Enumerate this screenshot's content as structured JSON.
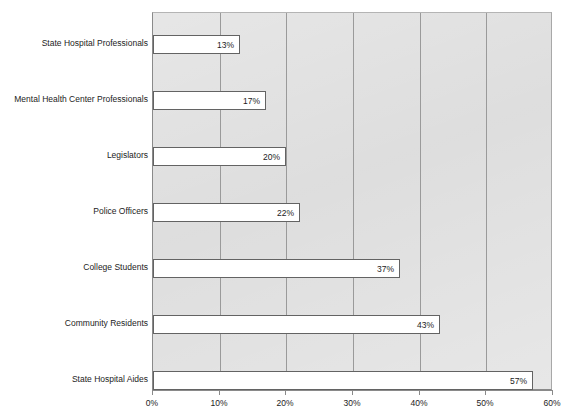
{
  "chart_data": {
    "type": "bar",
    "orientation": "horizontal",
    "title": "",
    "subtitle": "",
    "xlabel": "",
    "ylabel": "",
    "categories": [
      "State Hospital Professionals",
      "Mental Health Center Professionals",
      "Legislators",
      "Police Officers",
      "College Students",
      "Community Residents",
      "State Hospital Aides"
    ],
    "values": [
      13,
      17,
      20,
      22,
      37,
      43,
      57
    ],
    "value_labels": [
      "13%",
      "17%",
      "20%",
      "22%",
      "37%",
      "43%",
      "57%"
    ],
    "xlim": [
      0,
      60
    ],
    "xticks": [
      0,
      10,
      20,
      30,
      40,
      50,
      60
    ],
    "xtick_labels": [
      "0%",
      "10%",
      "20%",
      "30%",
      "40%",
      "50%",
      "60%"
    ],
    "grid": true,
    "grid_axis": "x",
    "legend": false,
    "legend_position": "none",
    "bar_fill_color": "#ffffff",
    "bar_border_color": "#636363",
    "plot_background_color": "#dcdcdc",
    "gridline_color": "#9a9a9a",
    "axis_color": "#8a8a8a",
    "text_color": "#1c1c1c"
  }
}
